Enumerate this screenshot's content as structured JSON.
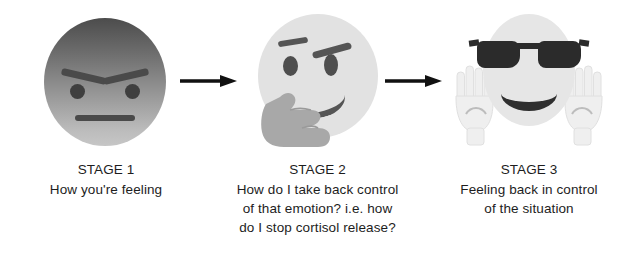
{
  "graphic": {
    "type": "three-stage-emoji-flow",
    "background_color": "#ffffff",
    "text_color": "#1d1d1d",
    "arrow_color": "#111111"
  },
  "stages": [
    {
      "id": "stage-1",
      "title": "STAGE 1",
      "lines": [
        "How you're feeling"
      ],
      "emoji_name": "angry-face",
      "emoji_colors": {
        "face_top": "#4c4c4c",
        "face_bottom": "#c6c6c6",
        "features": "#4a4a4a"
      }
    },
    {
      "id": "stage-2",
      "title": "STAGE 2",
      "lines": [
        "How do I take back control",
        "of that emotion? i.e. how",
        "do I stop cortisol release?"
      ],
      "emoji_name": "thinking-face",
      "emoji_colors": {
        "face": "#e2e2e2",
        "hand": "#a8a8a8",
        "features": "#555555"
      }
    },
    {
      "id": "stage-3",
      "title": "STAGE 3",
      "lines": [
        "Feeling back in control",
        "of the situation"
      ],
      "emoji_name": "smiling-face-with-sunglasses-hands-raised",
      "emoji_colors": {
        "face": "#e6e6e6",
        "sunglasses": "#2b2b2b",
        "hands": "#efefef"
      }
    }
  ],
  "arrows": [
    {
      "id": "arrow-1",
      "direction": "right"
    },
    {
      "id": "arrow-2",
      "direction": "right"
    }
  ]
}
